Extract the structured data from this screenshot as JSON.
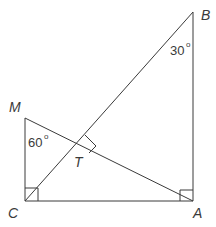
{
  "diagram": {
    "type": "geometry",
    "colors": {
      "stroke": "#3a3a3a",
      "background": "#ffffff"
    },
    "points": {
      "A": {
        "label": "A",
        "x": 193,
        "y": 201
      },
      "B": {
        "label": "B",
        "x": 193,
        "y": 12
      },
      "C": {
        "label": "C",
        "x": 25,
        "y": 201
      },
      "M": {
        "label": "M",
        "x": 25,
        "y": 118
      },
      "T": {
        "label": "T",
        "x": 77,
        "y": 144
      }
    },
    "segments": [
      "CA",
      "AB",
      "BC",
      "CM",
      "MA"
    ],
    "angles": {
      "B": {
        "value": "30",
        "unit": "°"
      },
      "M": {
        "value": "60",
        "unit": "°"
      }
    },
    "right_angles": [
      "C",
      "A",
      "T"
    ]
  }
}
